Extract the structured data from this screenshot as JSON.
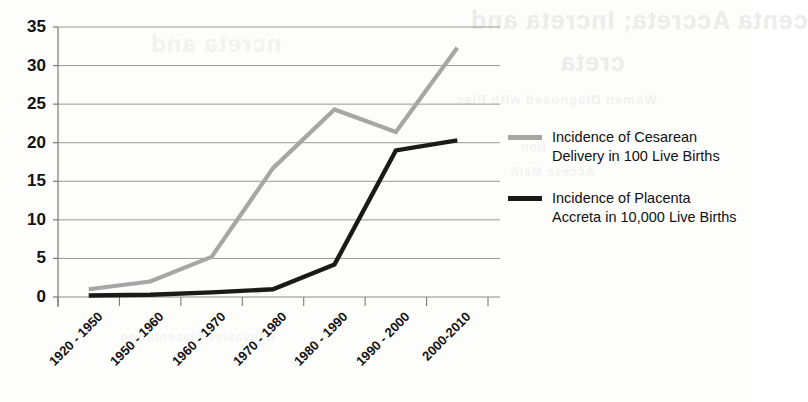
{
  "chart_data": {
    "type": "line",
    "title": "",
    "xlabel": "",
    "ylabel": "",
    "categories": [
      "1920 - 1950",
      "1950 - 1960",
      "1960 - 1970",
      "1970 - 1980",
      "1980 - 1990",
      "1990 - 2000",
      "2000-2010"
    ],
    "series": [
      {
        "name": "Incidence of Cesarean Delivery in 100 Live Births",
        "color": "#a6a6a6",
        "values": [
          1.0,
          2.0,
          5.2,
          16.7,
          24.3,
          21.4,
          32.3
        ]
      },
      {
        "name": "Incidence of Placenta Accreta in 10,000 Live Births",
        "color": "#1a1a1a",
        "values": [
          0.2,
          0.3,
          0.6,
          1.0,
          4.2,
          19.0,
          20.3
        ]
      }
    ],
    "ylim": [
      0,
      35
    ],
    "yticks": [
      0,
      5,
      10,
      15,
      20,
      25,
      30,
      35
    ],
    "ytick_labels": [
      "0",
      "5",
      "10",
      "15",
      "20",
      "25",
      "30",
      "35"
    ],
    "grid": true,
    "grid_color": "#8c8c8c",
    "legend_position": "right",
    "axis_color": "#7a7a7a"
  },
  "legend": {
    "entries": [
      {
        "label": "Incidence of Cesarean Delivery in 100 Live Births",
        "color": "#a6a6a6"
      },
      {
        "label": "Incidence of Placenta Accreta in 10,000 Live Births",
        "color": "#1a1a1a"
      }
    ]
  },
  "background_bleed": {
    "line1": "centa Accreta; Increta and",
    "line2": "creta",
    "line3": "Women Diagnosed with Plac",
    "line4": "tion",
    "line5": "Access Meth",
    "line6": "ncreta and",
    "line7": "n invasive placentation"
  }
}
